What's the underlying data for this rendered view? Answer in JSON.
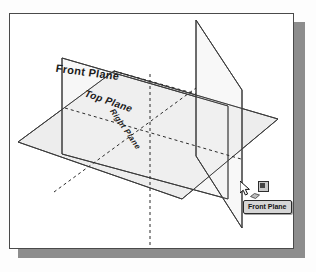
{
  "figure": {
    "planes": [
      {
        "id": "front",
        "label": "Front Plane",
        "fill": "#f0f0f0",
        "stroke": "#3c3c3c"
      },
      {
        "id": "top",
        "label": "Top Plane",
        "fill": "#e9e9e9",
        "stroke": "#3c3c3c"
      },
      {
        "id": "right",
        "label": "Right Plane",
        "fill": "#ededed",
        "stroke": "#3c3c3c"
      }
    ],
    "colors": {
      "frame_border": "#4a4a4a",
      "frame_background": "#ffffff",
      "shadow": "#8d8d8d",
      "line": "#3c3c3c",
      "dashed_line": "#2a2a2a",
      "label_text": "#1b1b1b"
    }
  },
  "cursor": {
    "icon": "arrow-pointer",
    "badge_icon": "plane-select-badge",
    "sub_icon": "plane-face-icon"
  },
  "tooltip": {
    "text": "Front Plane"
  }
}
